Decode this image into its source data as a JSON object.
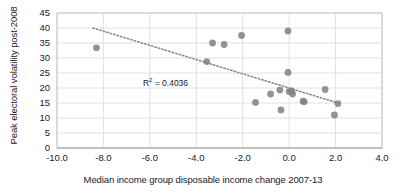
{
  "chart_data": {
    "type": "scatter",
    "title": "",
    "xlabel": "Median income group disposable income change 2007-13",
    "ylabel": "Peak electoral volatility post-2008",
    "xlim": [
      -10.0,
      4.0
    ],
    "ylim": [
      0,
      45
    ],
    "xticks": [
      "-10.0",
      "-8.0",
      "-6.0",
      "-4.0",
      "-2.0",
      "0.0",
      "2.0",
      "4.0"
    ],
    "xtick_values": [
      -10.0,
      -8.0,
      -6.0,
      -4.0,
      -2.0,
      0.0,
      2.0,
      4.0
    ],
    "yticks": [
      "0",
      "5",
      "10",
      "15",
      "20",
      "25",
      "30",
      "35",
      "40",
      "45"
    ],
    "ytick_values": [
      0,
      5,
      10,
      15,
      20,
      25,
      30,
      35,
      40,
      45
    ],
    "grid": "horizontal-and-vertical",
    "legend": "none",
    "marker_color": "#808080",
    "marker_size": 6,
    "annotations": [
      {
        "text": "R² = 0.4036",
        "x": -6.3,
        "y": 22.0
      }
    ],
    "trendline": {
      "type": "linear-dotted",
      "color": "#8c8c8c",
      "x_start": -8.45,
      "y_start": 40.0,
      "x_end": 2.15,
      "y_end": 14.9,
      "r_squared": 0.4036
    },
    "points": [
      {
        "x": -8.3,
        "y": 33.4
      },
      {
        "x": -3.55,
        "y": 28.8
      },
      {
        "x": -3.3,
        "y": 35.0
      },
      {
        "x": -2.8,
        "y": 34.5
      },
      {
        "x": -2.05,
        "y": 37.5
      },
      {
        "x": -1.45,
        "y": 15.2
      },
      {
        "x": -0.8,
        "y": 18.0
      },
      {
        "x": -0.4,
        "y": 19.3
      },
      {
        "x": -0.35,
        "y": 12.7
      },
      {
        "x": -0.05,
        "y": 39.0
      },
      {
        "x": -0.05,
        "y": 25.2
      },
      {
        "x": 0.0,
        "y": 18.8
      },
      {
        "x": 0.1,
        "y": 19.0
      },
      {
        "x": 0.15,
        "y": 18.0
      },
      {
        "x": 0.6,
        "y": 15.6
      },
      {
        "x": 0.65,
        "y": 15.4
      },
      {
        "x": 1.55,
        "y": 19.5
      },
      {
        "x": 2.1,
        "y": 14.8
      },
      {
        "x": 1.95,
        "y": 11.0
      }
    ]
  },
  "r2_label": {
    "prefix": "R",
    "sup": "2",
    "suffix": " = 0.4036"
  }
}
